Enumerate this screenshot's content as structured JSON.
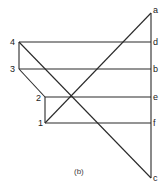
{
  "diagram": {
    "caption": "(b)",
    "nodes": {
      "p4": {
        "label": "4",
        "x": 19,
        "y": 42
      },
      "p3": {
        "label": "3",
        "x": 19,
        "y": 69
      },
      "p2": {
        "label": "2",
        "x": 45,
        "y": 97
      },
      "p1": {
        "label": "1",
        "x": 45,
        "y": 123
      },
      "a": {
        "label": "a",
        "x": 151,
        "y": 13
      },
      "d": {
        "label": "d",
        "x": 151,
        "y": 42
      },
      "b": {
        "label": "b",
        "x": 151,
        "y": 69
      },
      "e": {
        "label": "e",
        "x": 151,
        "y": 97
      },
      "f": {
        "label": "f",
        "x": 151,
        "y": 123
      },
      "c": {
        "label": "c",
        "x": 151,
        "y": 178
      }
    },
    "edges": [
      [
        "a",
        "c"
      ],
      [
        "p4",
        "d"
      ],
      [
        "p3",
        "b"
      ],
      [
        "p2",
        "e"
      ],
      [
        "p1",
        "f"
      ],
      [
        "p4",
        "p3"
      ],
      [
        "p3",
        "p2"
      ],
      [
        "p2",
        "p1"
      ],
      [
        "p1",
        "a"
      ],
      [
        "p4",
        "c"
      ]
    ]
  }
}
